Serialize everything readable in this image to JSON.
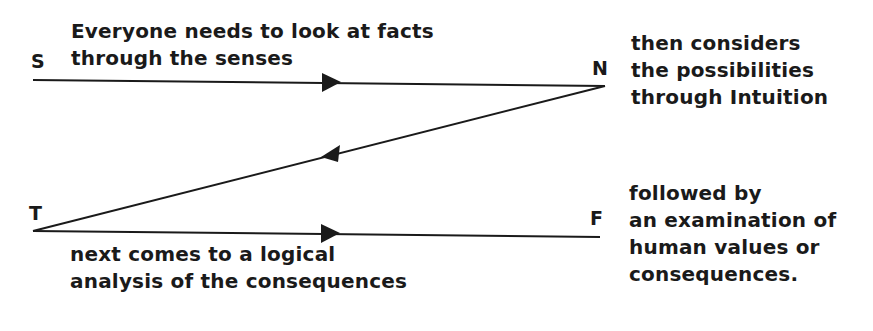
{
  "nodes": {
    "S": {
      "label": "S"
    },
    "N": {
      "label": "N"
    },
    "T": {
      "label": "T"
    },
    "F": {
      "label": "F"
    }
  },
  "captions": {
    "sensing": {
      "lines": [
        "Everyone needs to look at facts",
        "through the senses"
      ]
    },
    "intuition": {
      "lines": [
        "then considers",
        "the possibilities",
        "through Intuition"
      ]
    },
    "thinking": {
      "lines": [
        "next comes to a logical",
        "analysis of the consequences"
      ]
    },
    "feeling": {
      "lines": [
        "followed by",
        "an examination of",
        "human values or",
        "consequences."
      ]
    }
  },
  "edges": [
    {
      "from": "S",
      "to": "N",
      "direction": "right"
    },
    {
      "from": "N",
      "to": "T",
      "direction": "left"
    },
    {
      "from": "T",
      "to": "F",
      "direction": "right"
    }
  ],
  "colors": {
    "ink": "#1a1a1a",
    "background": "#ffffff"
  }
}
